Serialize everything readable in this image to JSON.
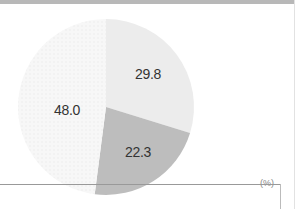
{
  "chart_data": {
    "type": "pie",
    "title": "",
    "unit": "(%)",
    "start_angle_deg": 0,
    "direction": "clockwise",
    "slices": [
      {
        "label": "29.8",
        "value": 29.8,
        "color": "#ececec"
      },
      {
        "label": "22.3",
        "value": 22.3,
        "color": "#bdbdbd"
      },
      {
        "label": "48.0",
        "value": 48.0,
        "color": "#f5f5f5"
      }
    ],
    "values": [
      29.8,
      22.3,
      48.0
    ],
    "categories": [
      "29.8",
      "22.3",
      "48.0"
    ]
  },
  "labels": {
    "slice_a": "29.8",
    "slice_b": "22.3",
    "slice_c": "48.0",
    "unit": "(%)"
  }
}
